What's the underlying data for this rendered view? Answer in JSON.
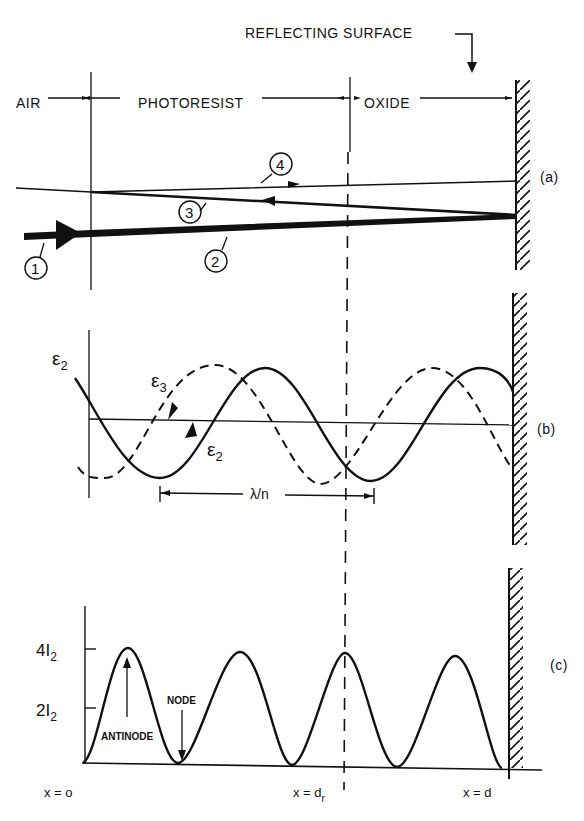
{
  "figure": {
    "header": {
      "reflecting_surface": "REFLECTING SURFACE",
      "regions": [
        "AIR",
        "PHOTORESIST",
        "OXIDE"
      ]
    },
    "panel_a": {
      "label": "(a)",
      "rays": [
        "1",
        "2",
        "3",
        "4"
      ]
    },
    "panel_b": {
      "label": "(b)",
      "field_labels": {
        "e2_left": "ε",
        "e2_left_sub": "2",
        "e3": "ε",
        "e3_sub": "3",
        "e2_arrow": "ε",
        "e2_arrow_sub": "2"
      },
      "wavelength_label": "λ/n"
    },
    "panel_c": {
      "label": "(c)",
      "y_ticks": [
        {
          "main": "4I",
          "sub": "2"
        },
        {
          "main": "2I",
          "sub": "2"
        }
      ],
      "antinode": "ANTINODE",
      "node": "NODE",
      "x_labels": {
        "origin": "x = o",
        "dr_main": "x = d",
        "dr_sub": "r",
        "d": "x = d"
      }
    }
  }
}
